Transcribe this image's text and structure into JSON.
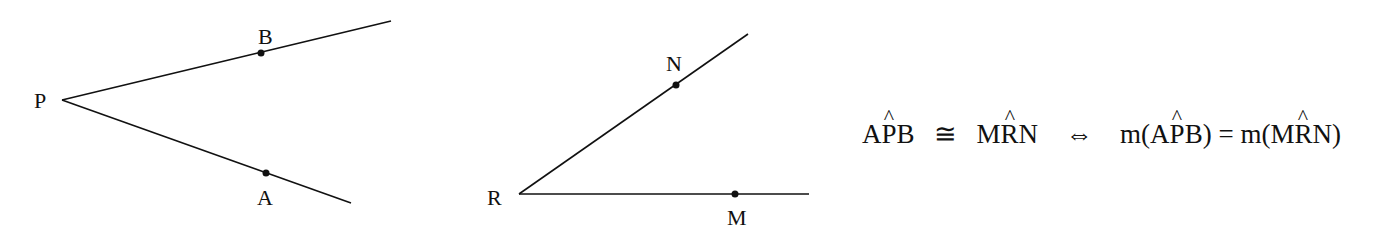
{
  "figures": {
    "angle_APB": {
      "vertex_label": "P",
      "point_on_upper_ray": "B",
      "point_on_lower_ray": "A"
    },
    "angle_MRN": {
      "vertex_label": "R",
      "point_on_upper_ray": "N",
      "point_on_lower_ray": "M"
    }
  },
  "formula": {
    "lhs_angle1": {
      "pre": "A",
      "hat": "P",
      "post": "B"
    },
    "congruent_symbol": "≅",
    "lhs_angle2": {
      "pre": "M",
      "hat": "R",
      "post": "N"
    },
    "iff_symbol": "⇔",
    "measure_fn": "m",
    "open_paren": "(",
    "close_paren": ")",
    "equals_symbol": "=",
    "rhs_angle1": {
      "pre": "A",
      "hat": "P",
      "post": "B"
    },
    "rhs_angle2": {
      "pre": "M",
      "hat": "R",
      "post": "N"
    }
  },
  "colors": {
    "stroke": "#111111",
    "background": "#ffffff"
  }
}
